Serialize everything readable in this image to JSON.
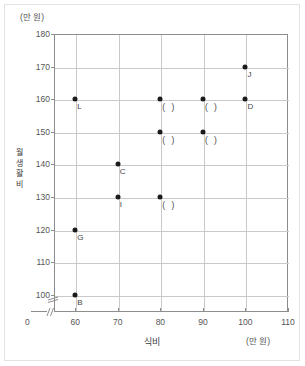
{
  "chart_data": {
    "type": "scatter",
    "title": "",
    "xlabel": "식비",
    "ylabel": "월 생활비",
    "x_unit": "(만 원)",
    "y_unit": "(만 원)",
    "xlim": [
      55,
      110
    ],
    "ylim": [
      95,
      180
    ],
    "xticks": [
      "0",
      "60",
      "70",
      "80",
      "90",
      "100",
      "110"
    ],
    "yticks": [
      "100",
      "110",
      "120",
      "130",
      "140",
      "150",
      "160",
      "170",
      "180"
    ],
    "grid": true,
    "legend": "none",
    "axis_break_x": true,
    "axis_break_y": true,
    "points": [
      {
        "label": "L",
        "x": 60,
        "y": 160
      },
      {
        "label": "G",
        "x": 60,
        "y": 120
      },
      {
        "label": "B",
        "x": 60,
        "y": 100
      },
      {
        "label": "C",
        "x": 70,
        "y": 140
      },
      {
        "label": "I",
        "x": 70,
        "y": 130
      },
      {
        "label": "( )",
        "x": 80,
        "y": 160
      },
      {
        "label": "( )",
        "x": 80,
        "y": 150
      },
      {
        "label": "( )",
        "x": 80,
        "y": 130
      },
      {
        "label": "( )",
        "x": 90,
        "y": 160
      },
      {
        "label": "( )",
        "x": 90,
        "y": 150
      },
      {
        "label": "D",
        "x": 100,
        "y": 160
      },
      {
        "label": "J",
        "x": 100,
        "y": 170
      }
    ]
  },
  "colors": {
    "point": "#1a1a1a",
    "grid": "#c9c9c9",
    "axis": "#8d8d8d",
    "text": "#555555"
  }
}
